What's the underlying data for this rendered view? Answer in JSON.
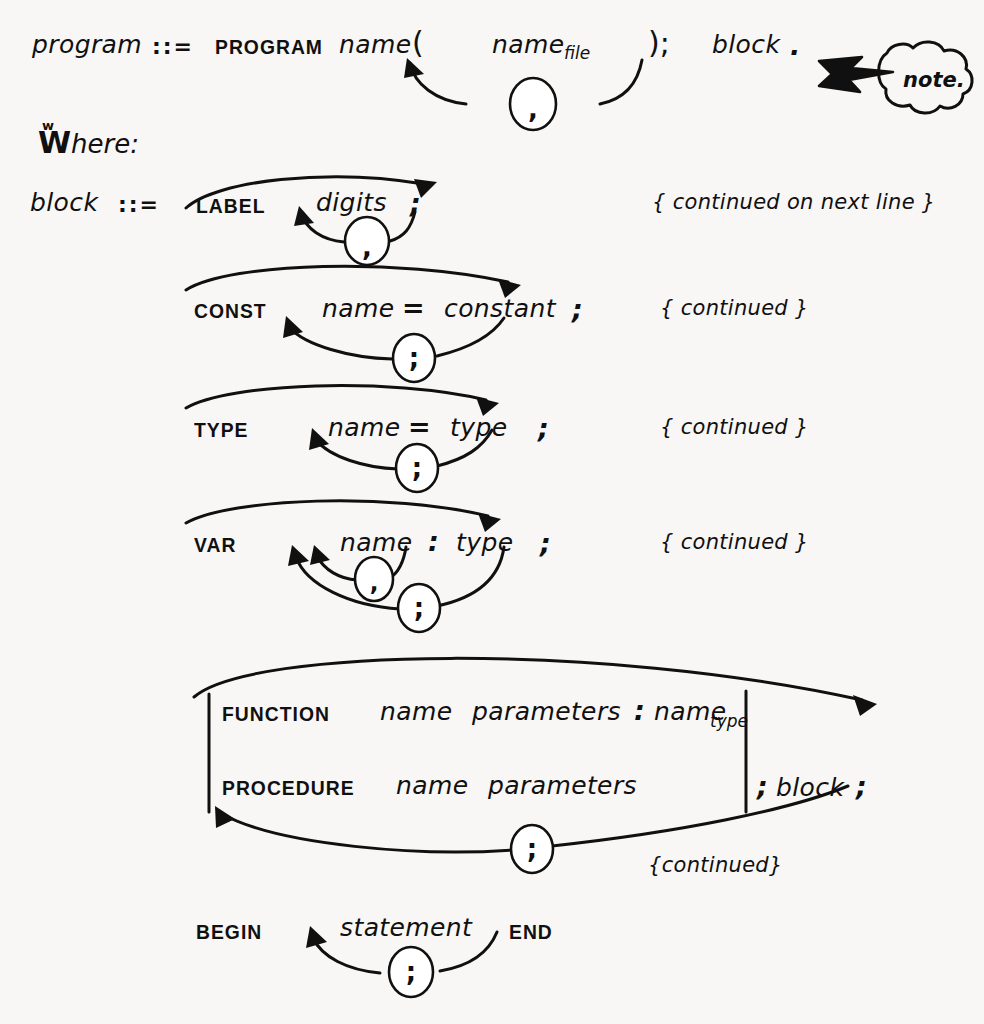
{
  "document": {
    "kind": "hand-drawn-syntax-diagram",
    "notation": "::=",
    "where_label": "Where:",
    "ink_color": "#111010",
    "background_color": "#f8f7f5"
  },
  "callout": {
    "label": "note.",
    "shape": "cloud-bubble",
    "pointer": "lightning-arrow-left"
  },
  "productions": [
    {
      "id": "program",
      "lhs": "program",
      "def_symbol": "::=",
      "tokens": [
        {
          "text": "PROGRAM",
          "kind": "terminal"
        },
        {
          "text": "name",
          "kind": "nonterminal"
        },
        {
          "text": "(",
          "kind": "punctuation"
        },
        {
          "text": "name",
          "kind": "nonterminal",
          "subscript": "file"
        },
        {
          "text": ")",
          "kind": "punctuation"
        },
        {
          "text": ";",
          "kind": "punctuation"
        },
        {
          "text": "block",
          "kind": "nonterminal"
        },
        {
          "text": ".",
          "kind": "punctuation"
        }
      ],
      "loops": [
        {
          "separator": ",",
          "repeats": "name_file"
        }
      ]
    },
    {
      "id": "block-label",
      "lhs": "block",
      "def_symbol": "::=",
      "tokens": [
        {
          "text": "LABEL",
          "kind": "terminal"
        },
        {
          "text": "digits",
          "kind": "nonterminal"
        },
        {
          "text": ";",
          "kind": "punctuation"
        }
      ],
      "loops": [
        {
          "separator": ",",
          "repeats": "digits"
        }
      ],
      "bypass": true,
      "comment": "{ continued on next line }"
    },
    {
      "id": "block-const",
      "lhs": "",
      "def_symbol": "",
      "tokens": [
        {
          "text": "CONST",
          "kind": "terminal"
        },
        {
          "text": "name",
          "kind": "nonterminal"
        },
        {
          "text": "=",
          "kind": "punctuation"
        },
        {
          "text": "constant",
          "kind": "nonterminal"
        },
        {
          "text": ";",
          "kind": "punctuation"
        }
      ],
      "loops": [
        {
          "separator": ";",
          "repeats": "name = constant ;"
        }
      ],
      "bypass": true,
      "comment": "{ continued }"
    },
    {
      "id": "block-type",
      "lhs": "",
      "def_symbol": "",
      "tokens": [
        {
          "text": "TYPE",
          "kind": "terminal"
        },
        {
          "text": "name",
          "kind": "nonterminal"
        },
        {
          "text": "=",
          "kind": "punctuation"
        },
        {
          "text": "type",
          "kind": "nonterminal"
        },
        {
          "text": ";",
          "kind": "punctuation"
        }
      ],
      "loops": [
        {
          "separator": ";",
          "repeats": "name = type ;"
        }
      ],
      "bypass": true,
      "comment": "{ continued }"
    },
    {
      "id": "block-var",
      "lhs": "",
      "def_symbol": "",
      "tokens": [
        {
          "text": "VAR",
          "kind": "terminal"
        },
        {
          "text": "name",
          "kind": "nonterminal"
        },
        {
          "text": ":",
          "kind": "punctuation"
        },
        {
          "text": "type",
          "kind": "nonterminal"
        },
        {
          "text": ";",
          "kind": "punctuation"
        }
      ],
      "loops": [
        {
          "separator": ",",
          "repeats": "name"
        },
        {
          "separator": ";",
          "repeats": "name : type ;"
        }
      ],
      "bypass": true,
      "comment": "{ continued }"
    },
    {
      "id": "block-subprograms",
      "lhs": "",
      "def_symbol": "",
      "alternatives": [
        {
          "tokens": [
            {
              "text": "FUNCTION",
              "kind": "terminal"
            },
            {
              "text": "name",
              "kind": "nonterminal"
            },
            {
              "text": "parameters",
              "kind": "nonterminal"
            },
            {
              "text": ":",
              "kind": "punctuation"
            },
            {
              "text": "name",
              "kind": "nonterminal",
              "subscript": "type"
            }
          ]
        },
        {
          "tokens": [
            {
              "text": "PROCEDURE",
              "kind": "terminal"
            },
            {
              "text": "name",
              "kind": "nonterminal"
            },
            {
              "text": "parameters",
              "kind": "nonterminal"
            }
          ]
        }
      ],
      "tail_tokens": [
        {
          "text": ";",
          "kind": "punctuation"
        },
        {
          "text": "block",
          "kind": "nonterminal"
        },
        {
          "text": ";",
          "kind": "punctuation"
        }
      ],
      "loops": [
        {
          "separator": ";",
          "repeats": "subprogram declaration"
        }
      ],
      "bypass": true,
      "comment": "{continued}"
    },
    {
      "id": "block-begin-end",
      "lhs": "",
      "def_symbol": "",
      "tokens": [
        {
          "text": "BEGIN",
          "kind": "terminal"
        },
        {
          "text": "statement",
          "kind": "nonterminal"
        },
        {
          "text": "END",
          "kind": "terminal"
        }
      ],
      "loops": [
        {
          "separator": ";",
          "repeats": "statement"
        }
      ],
      "bypass": false,
      "comment": ""
    }
  ],
  "labels": {
    "program": "program",
    "block": "block",
    "name": "name",
    "name_sub_file": "file",
    "name_sub_type": "type",
    "digits": "digits",
    "constant": "constant",
    "type": "type",
    "parameters": "parameters",
    "statement": "statement",
    "kw_program": "PROGRAM",
    "kw_label": "LABEL",
    "kw_const": "CONST",
    "kw_type": "TYPE",
    "kw_var": "VAR",
    "kw_function": "FUNCTION",
    "kw_procedure": "PROCEDURE",
    "kw_begin": "BEGIN",
    "kw_end": "END",
    "def": "::=",
    "lparen": "(",
    "rparen": ")",
    "semi": ";",
    "comma": ",",
    "colon": ":",
    "equals": "=",
    "period": ".",
    "semicolon_paren": ");",
    "comment_next_line": "{ continued on next line }",
    "comment_continued": "{ continued }",
    "comment_continued_tight": "{continued}",
    "where": "here:",
    "where_cap": "W",
    "where_deco": "w",
    "note": "note."
  }
}
